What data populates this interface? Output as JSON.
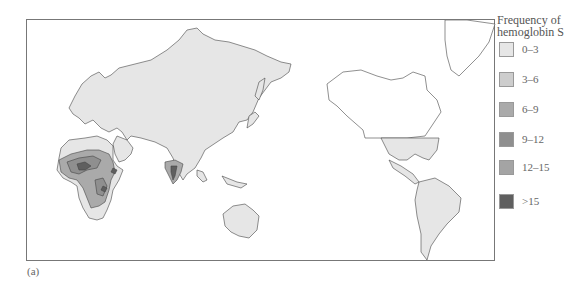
{
  "caption": "(a)",
  "legend": {
    "title_line1": "Frequency of",
    "title_line2": "hemoglobin S",
    "items": [
      {
        "label": "0–3",
        "color": "#e6e6e6"
      },
      {
        "label": "3–6",
        "color": "#cdcdcd"
      },
      {
        "label": "6–9",
        "color": "#aaaaaa"
      },
      {
        "label": "9–12",
        "color": "#8f8f8f"
      },
      {
        "label": "12–15",
        "color": "#a4a4a4"
      },
      {
        "label": ">15",
        "color": "#5f5f5f"
      }
    ]
  },
  "map": {
    "land_color": "#e6e6e6",
    "unshaded_land_color": "#ffffff",
    "outline_color": "#444444",
    "regions": [
      "Europe",
      "Africa",
      "Asia",
      "Australia",
      "North America",
      "South America",
      "Greenland"
    ]
  }
}
